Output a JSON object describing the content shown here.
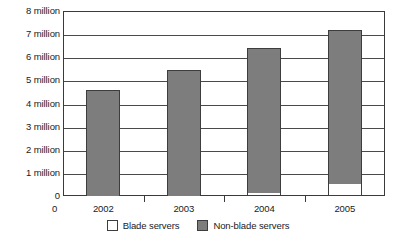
{
  "chart_data": {
    "type": "bar",
    "title": "",
    "subtitle": "",
    "xlabel": "",
    "ylabel": "",
    "stacked": true,
    "grid": true,
    "legend_position": "bottom-center",
    "categories": [
      "2002",
      "2003",
      "2004",
      "2005"
    ],
    "x_origin_label": "0",
    "ylim": [
      0,
      8
    ],
    "y_unit": "million",
    "y_ticks": [
      0,
      1,
      2,
      3,
      4,
      5,
      6,
      7,
      8
    ],
    "y_tick_labels": [
      "8 million",
      "7 million",
      "6 million",
      "5 million",
      "4 million",
      "3 million",
      "2 million",
      "1 million",
      "0"
    ],
    "series": [
      {
        "name": "Blade servers",
        "color": "#ffffff",
        "values": [
          0,
          0,
          0.15,
          0.5
        ]
      },
      {
        "name": "Non-blade servers",
        "color": "#7d7d7d",
        "values": [
          4.6,
          5.45,
          6.25,
          6.7
        ]
      }
    ],
    "totals": [
      4.6,
      5.45,
      6.4,
      7.2
    ]
  },
  "legend": {
    "items": [
      {
        "label": "Blade servers",
        "swatch": "white-square-swatch"
      },
      {
        "label": "Non-blade servers",
        "swatch": "gray-square-swatch"
      }
    ]
  },
  "colors": {
    "nonblade": "#7d7d7d",
    "blade": "#ffffff",
    "axis": "#3a3a3a",
    "grid": "#4a4a4a",
    "text": "#1a1a1a"
  }
}
